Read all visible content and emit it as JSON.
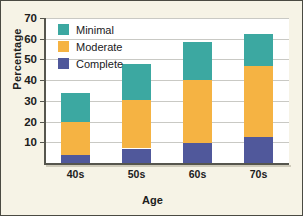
{
  "chart_data": {
    "type": "bar",
    "stacked": true,
    "title": "",
    "xlabel": "Age",
    "ylabel": "Percentage",
    "categories": [
      "40s",
      "50s",
      "60s",
      "70s"
    ],
    "series": [
      {
        "name": "Complete",
        "color": "#50589b",
        "values": [
          4,
          7,
          9.5,
          12.5
        ]
      },
      {
        "name": "Moderate",
        "color": "#f5b343",
        "values": [
          16,
          23.5,
          30.5,
          34.5
        ]
      },
      {
        "name": "Minimal",
        "color": "#3ca8a1",
        "values": [
          14,
          17.5,
          18.5,
          15.5
        ]
      }
    ],
    "totals": [
      34,
      48,
      58.5,
      62.5
    ],
    "ylim": [
      0,
      70
    ],
    "yticks": [
      10,
      20,
      30,
      40,
      50,
      60,
      70
    ],
    "ytick_labels": [
      "10",
      "20",
      "30",
      "40",
      "50",
      "60",
      "70"
    ],
    "grid": true,
    "legend_position": "top-left",
    "legend_order": [
      "Minimal",
      "Moderate",
      "Complete"
    ]
  },
  "legend": {
    "items": [
      {
        "label": "Minimal",
        "color": "#3ca8a1"
      },
      {
        "label": "Moderate",
        "color": "#f5b343"
      },
      {
        "label": "Complete",
        "color": "#50589b"
      }
    ]
  },
  "axes": {
    "y_title": "Percentage",
    "x_title": "Age"
  }
}
